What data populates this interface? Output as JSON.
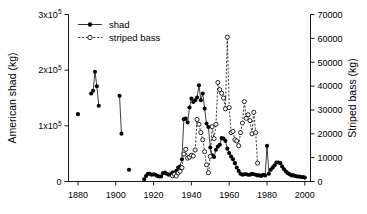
{
  "chart_data": {
    "type": "line",
    "title": "",
    "xlabel": "",
    "ylabel": "American shad (kg)",
    "y2label": "Striped bass (kg)",
    "xlim": [
      1875,
      2003
    ],
    "ylim": [
      0,
      300000
    ],
    "y2lim": [
      0,
      70000
    ],
    "grid": false,
    "legend_position": "top-left",
    "x_ticks": [
      1880,
      1900,
      1920,
      1940,
      1960,
      1980,
      2000
    ],
    "x_tick_labels": [
      "1880",
      "1900",
      "1920",
      "1940",
      "1960",
      "1980",
      "2000"
    ],
    "y_ticks": [
      0,
      100000,
      200000,
      300000
    ],
    "y_tick_labels": [
      "0",
      "1x10",
      "2x10",
      "3x10"
    ],
    "y_tick_exponent": "5",
    "y2_ticks": [
      0,
      10000,
      20000,
      30000,
      40000,
      50000,
      60000,
      70000
    ],
    "y2_tick_labels": [
      "0",
      "10000",
      "20000",
      "30000",
      "40000",
      "50000",
      "60000",
      "70000"
    ],
    "series": [
      {
        "name": "shad",
        "axis": "left",
        "marker": "filled-circle",
        "linestyle": "solid",
        "color": "#000000",
        "points": [
          [
            1880,
            121000
          ],
          [
            1887,
            158000
          ],
          [
            1888,
            163000
          ],
          [
            1889,
            197000
          ],
          [
            1890,
            171000
          ],
          [
            1891,
            136000
          ],
          [
            1902,
            154000
          ],
          [
            1903,
            86000
          ],
          [
            1907,
            21000
          ],
          [
            1915,
            4000
          ],
          [
            1916,
            10000
          ],
          [
            1917,
            14000
          ],
          [
            1918,
            14000
          ],
          [
            1919,
            12000
          ],
          [
            1920,
            13000
          ],
          [
            1921,
            12000
          ],
          [
            1922,
            10000
          ],
          [
            1923,
            9000
          ],
          [
            1924,
            9000
          ],
          [
            1925,
            15000
          ],
          [
            1926,
            16000
          ],
          [
            1927,
            14000
          ],
          [
            1928,
            12000
          ],
          [
            1929,
            13000
          ],
          [
            1930,
            16000
          ],
          [
            1931,
            16000
          ],
          [
            1932,
            19000
          ],
          [
            1933,
            25000
          ],
          [
            1934,
            27000
          ],
          [
            1935,
            40000
          ],
          [
            1936,
            112000
          ],
          [
            1937,
            113000
          ],
          [
            1938,
            106000
          ],
          [
            1939,
            133000
          ],
          [
            1940,
            149000
          ],
          [
            1941,
            143000
          ],
          [
            1942,
            146000
          ],
          [
            1943,
            151000
          ],
          [
            1944,
            173000
          ],
          [
            1945,
            146000
          ],
          [
            1946,
            158000
          ],
          [
            1947,
            131000
          ],
          [
            1948,
            104000
          ],
          [
            1949,
            98000
          ],
          [
            1950,
            61000
          ],
          [
            1951,
            47000
          ],
          [
            1952,
            44000
          ],
          [
            1953,
            57000
          ],
          [
            1954,
            63000
          ],
          [
            1955,
            66000
          ],
          [
            1956,
            78000
          ],
          [
            1957,
            77000
          ],
          [
            1958,
            73000
          ],
          [
            1959,
            59000
          ],
          [
            1960,
            51000
          ],
          [
            1961,
            45000
          ],
          [
            1962,
            40000
          ],
          [
            1963,
            33000
          ],
          [
            1964,
            25000
          ],
          [
            1965,
            19000
          ],
          [
            1966,
            14000
          ],
          [
            1967,
            12000
          ],
          [
            1968,
            13000
          ],
          [
            1969,
            13000
          ],
          [
            1970,
            12000
          ],
          [
            1971,
            12000
          ],
          [
            1972,
            14000
          ],
          [
            1973,
            13000
          ],
          [
            1974,
            12000
          ],
          [
            1975,
            11000
          ],
          [
            1976,
            11000
          ],
          [
            1977,
            10000
          ],
          [
            1978,
            12000
          ],
          [
            1979,
            11000
          ],
          [
            1980,
            64000
          ],
          [
            1981,
            14000
          ],
          [
            1982,
            21000
          ],
          [
            1983,
            25000
          ],
          [
            1984,
            29000
          ],
          [
            1985,
            34000
          ],
          [
            1986,
            34000
          ],
          [
            1987,
            33000
          ],
          [
            1988,
            27000
          ],
          [
            1989,
            22000
          ],
          [
            1990,
            18000
          ],
          [
            1991,
            15000
          ],
          [
            1992,
            13000
          ],
          [
            1993,
            11000
          ],
          [
            1994,
            11000
          ],
          [
            1995,
            10000
          ],
          [
            1996,
            9000
          ],
          [
            1997,
            9000
          ],
          [
            1998,
            8000
          ],
          [
            1999,
            8000
          ],
          [
            2000,
            7000
          ]
        ]
      },
      {
        "name": "striped bass",
        "axis": "right",
        "marker": "open-circle",
        "linestyle": "dashed",
        "color": "#000000",
        "points": [
          [
            1930,
            2400
          ],
          [
            1931,
            3000
          ],
          [
            1932,
            2300
          ],
          [
            1933,
            3600
          ],
          [
            1934,
            4300
          ],
          [
            1935,
            5800
          ],
          [
            1936,
            11500
          ],
          [
            1937,
            13500
          ],
          [
            1938,
            9800
          ],
          [
            1939,
            10200
          ],
          [
            1940,
            11000
          ],
          [
            1941,
            10700
          ],
          [
            1942,
            13200
          ],
          [
            1943,
            26000
          ],
          [
            1944,
            24000
          ],
          [
            1945,
            20500
          ],
          [
            1946,
            17500
          ],
          [
            1947,
            12500
          ],
          [
            1948,
            7000
          ],
          [
            1949,
            3700
          ],
          [
            1950,
            10500
          ],
          [
            1951,
            23000
          ],
          [
            1952,
            18000
          ],
          [
            1953,
            24000
          ],
          [
            1954,
            41500
          ],
          [
            1955,
            38500
          ],
          [
            1956,
            37000
          ],
          [
            1957,
            35000
          ],
          [
            1958,
            30500
          ],
          [
            1959,
            60500
          ],
          [
            1960,
            31000
          ],
          [
            1961,
            20500
          ],
          [
            1962,
            21000
          ],
          [
            1963,
            17500
          ],
          [
            1964,
            17000
          ],
          [
            1965,
            15000
          ],
          [
            1966,
            20500
          ],
          [
            1967,
            24500
          ],
          [
            1968,
            33500
          ],
          [
            1969,
            26500
          ],
          [
            1970,
            28000
          ],
          [
            1971,
            25500
          ],
          [
            1972,
            20000
          ],
          [
            1973,
            29000
          ],
          [
            1974,
            20500
          ],
          [
            1975,
            7700
          ]
        ]
      }
    ]
  },
  "legend": {
    "items": [
      {
        "label": "shad"
      },
      {
        "label": "striped bass"
      }
    ]
  }
}
